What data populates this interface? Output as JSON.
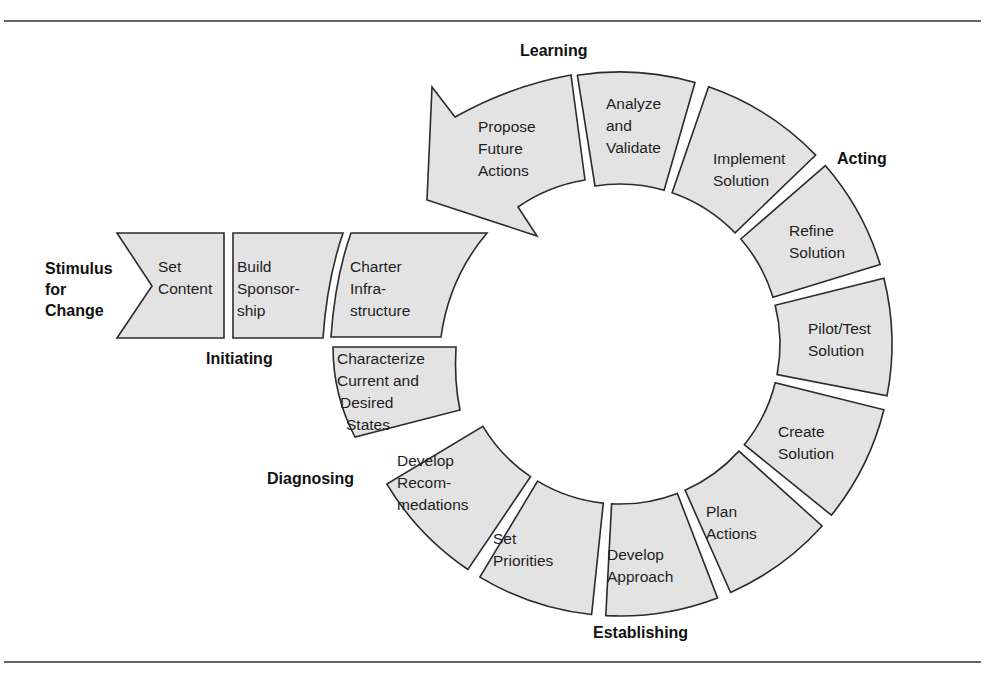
{
  "diagram": {
    "colors": {
      "segment_fill": "#e3e3e3",
      "segment_stroke": "#2b2b2b",
      "text": "#1e1e1e"
    },
    "stimulus": [
      "Stimulus",
      "for",
      "Change"
    ],
    "phases": {
      "initiating": "Initiating",
      "diagnosing": "Diagnosing",
      "establishing": "Establishing",
      "acting": "Acting",
      "learning": "Learning"
    },
    "steps": {
      "set_content": [
        "Set",
        "Content"
      ],
      "build_sponsorship": [
        "Build",
        "Sponsor-",
        "ship"
      ],
      "charter_infrastructure": [
        "Charter",
        "Infra-",
        "structure"
      ],
      "characterize_states": [
        "Characterize",
        "Current and",
        "Desired",
        "States"
      ],
      "develop_recommendations": [
        "Develop",
        "Recom-",
        "medations"
      ],
      "set_priorities": [
        "Set",
        "Priorities"
      ],
      "develop_approach": [
        "Develop",
        "Approach"
      ],
      "plan_actions": [
        "Plan",
        "Actions"
      ],
      "create_solution": [
        "Create",
        "Solution"
      ],
      "pilot_test_solution": [
        "Pilot/Test",
        "Solution"
      ],
      "refine_solution": [
        "Refine",
        "Solution"
      ],
      "implement_solution": [
        "Implement",
        "Solution"
      ],
      "analyze_validate": [
        "Analyze",
        "and",
        "Validate"
      ],
      "propose_future_actions": [
        "Propose",
        "Future",
        "Actions"
      ]
    }
  }
}
